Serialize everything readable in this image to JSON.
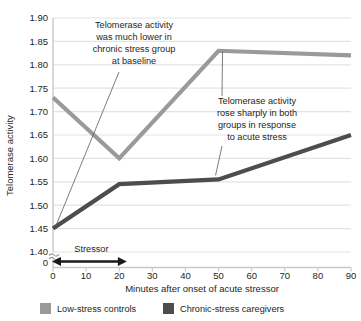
{
  "chart_data": {
    "type": "line",
    "title": "",
    "xlabel": "Minutes after onset of acute stressor",
    "ylabel": "Telomerase activity",
    "xlim": [
      0,
      90
    ],
    "ylim": [
      1.4,
      1.9
    ],
    "grid": true,
    "axis_break": true,
    "legend_position": "bottom",
    "x": [
      0,
      20,
      50,
      90
    ],
    "xticks": [
      "0",
      "10",
      "20",
      "30",
      "40",
      "50",
      "60",
      "70",
      "80",
      "90"
    ],
    "xtick_values": [
      0,
      10,
      20,
      30,
      40,
      50,
      60,
      70,
      80,
      90
    ],
    "yticks": [
      "1.40",
      "1.45",
      "1.50",
      "1.55",
      "1.60",
      "1.65",
      "1.70",
      "1.75",
      "1.80",
      "1.85",
      "1.90"
    ],
    "ytick_values": [
      1.4,
      1.45,
      1.5,
      1.55,
      1.6,
      1.65,
      1.7,
      1.75,
      1.8,
      1.85,
      1.9
    ],
    "y_origin_label": "0",
    "series": [
      {
        "name": "Low-stress controls",
        "color": "#9a9a9a",
        "values": [
          1.73,
          1.6,
          1.83,
          1.82
        ]
      },
      {
        "name": "Chronic-stress caregivers",
        "color": "#4d4d4d",
        "values": [
          1.45,
          1.545,
          1.555,
          1.65
        ]
      }
    ],
    "annotations": [
      {
        "id": "baseline-note",
        "lines": [
          "Telomerase activity",
          "was much lower in",
          "chronic stress group",
          "at baseline"
        ],
        "points_to_x": 0,
        "points_to_y": 1.45
      },
      {
        "id": "acute-stress-note",
        "lines": [
          "Telomerase activity",
          "rose sharply in both",
          "groups in response",
          "to acute stress"
        ],
        "points_to_x": 50,
        "points_to_y": 1.555
      }
    ],
    "stressor_marker": {
      "label": "Stressor",
      "from_x": 0,
      "to_x": 22
    }
  },
  "legend": {
    "items": [
      {
        "label": "Low-stress controls",
        "color": "#9a9a9a"
      },
      {
        "label": "Chronic-stress caregivers",
        "color": "#4d4d4d"
      }
    ]
  },
  "colors": {
    "gridline": "#e3e3e3",
    "axis": "#d0d0d0",
    "text": "#231f20",
    "series_light": "#9a9a9a",
    "series_dark": "#4d4d4d",
    "background": "#ffffff"
  }
}
